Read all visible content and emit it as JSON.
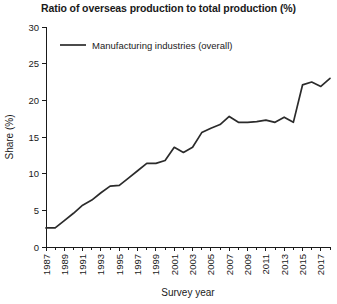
{
  "chart_data": {
    "type": "line",
    "title": "Ratio of overseas production to total production (%)",
    "xlabel": "Survey year",
    "ylabel": "Share (%)",
    "ylim": [
      0,
      30
    ],
    "xlim": [
      1987,
      2018
    ],
    "ytick_labels": [
      "0",
      "5",
      "10",
      "15",
      "20",
      "25",
      "30"
    ],
    "ytick_values": [
      0,
      5,
      10,
      15,
      20,
      25,
      30
    ],
    "xtick_labels": [
      "1987",
      "1989",
      "1991",
      "1993",
      "1995",
      "1997",
      "1999",
      "2001",
      "2003",
      "2005",
      "2007",
      "2009",
      "2011",
      "2013",
      "2015",
      "2017"
    ],
    "xtick_values": [
      1987,
      1989,
      1991,
      1993,
      1995,
      1997,
      1999,
      2001,
      2003,
      2005,
      2007,
      2009,
      2011,
      2013,
      2015,
      2017
    ],
    "minor_xticks": [
      1988,
      1990,
      1992,
      1994,
      1996,
      1998,
      2000,
      2002,
      2004,
      2006,
      2008,
      2010,
      2012,
      2014,
      2016,
      2018
    ],
    "grid": false,
    "legend_position": "top-left-inside",
    "series": [
      {
        "name": "Manufacturing industries (overall)",
        "color": "#2b2b2b",
        "x": [
          1987,
          1988,
          1989,
          1990,
          1991,
          1992,
          1993,
          1994,
          1995,
          1996,
          1997,
          1998,
          1999,
          2000,
          2001,
          2002,
          2003,
          2004,
          2005,
          2006,
          2007,
          2008,
          2009,
          2010,
          2011,
          2012,
          2013,
          2014,
          2015,
          2016,
          2017,
          2018
        ],
        "values": [
          2.6,
          2.6,
          3.6,
          4.6,
          5.7,
          6.4,
          7.4,
          8.3,
          8.4,
          9.4,
          10.4,
          11.4,
          11.4,
          11.8,
          13.6,
          12.9,
          13.6,
          15.6,
          16.2,
          16.7,
          17.8,
          17.0,
          17.0,
          17.1,
          17.3,
          17.0,
          17.7,
          17.0,
          22.1,
          22.5,
          21.9,
          23.0
        ],
        "data_labels": []
      }
    ],
    "annotations": []
  },
  "legend": {
    "entries": [
      {
        "label": "Manufacturing industries (overall)",
        "color": "#2b2b2b"
      }
    ]
  },
  "colors": {
    "line": "#2b2b2b",
    "axis": "#1a1a1a",
    "background": "#ffffff"
  }
}
